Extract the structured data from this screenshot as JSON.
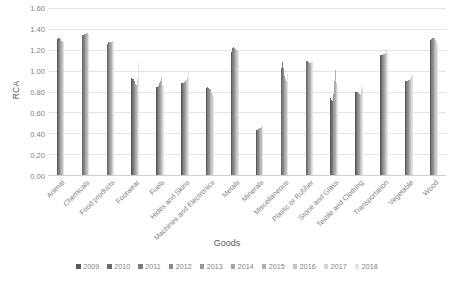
{
  "chart_data": {
    "type": "bar",
    "title": "",
    "xlabel": "Goods",
    "ylabel": "RCA",
    "ylim": [
      0.0,
      1.6
    ],
    "ytick_labels": [
      "0.00",
      "0.20",
      "0.40",
      "0.60",
      "0.80",
      "1.00",
      "1.20",
      "1.40",
      "1.60"
    ],
    "ytick_values": [
      0.0,
      0.2,
      0.4,
      0.6,
      0.8,
      1.0,
      1.2,
      1.4,
      1.6
    ],
    "grid": true,
    "legend_position": "bottom",
    "categories": [
      "Animal",
      "Chemicals",
      "Food products",
      "Footwear",
      "Fuels",
      "Hides and Skins",
      "Machines and Electronics",
      "Metals",
      "Minerals",
      "Miscellaneous",
      "Plastic or Rubber",
      "Stone and Glass",
      "Textile and Clothing",
      "Transportation",
      "Vegetable",
      "Wood"
    ],
    "series": [
      {
        "name": "2009",
        "color": "#595959",
        "values": [
          1.3,
          1.33,
          1.26,
          0.93,
          0.84,
          0.88,
          0.83,
          1.18,
          0.43,
          1.0,
          1.09,
          0.74,
          0.8,
          1.15,
          0.9,
          1.29
        ]
      },
      {
        "name": "2010",
        "color": "#6b6b6b",
        "values": [
          1.31,
          1.34,
          1.26,
          0.92,
          0.84,
          0.88,
          0.83,
          1.21,
          0.43,
          1.03,
          1.09,
          0.72,
          0.8,
          1.15,
          0.9,
          1.3
        ]
      },
      {
        "name": "2011",
        "color": "#7a7a7a",
        "values": [
          1.31,
          1.34,
          1.27,
          0.92,
          0.84,
          0.88,
          0.84,
          1.22,
          0.43,
          1.08,
          1.09,
          0.71,
          0.8,
          1.15,
          0.9,
          1.3
        ]
      },
      {
        "name": "2012",
        "color": "#888888",
        "values": [
          1.31,
          1.35,
          1.27,
          0.9,
          0.85,
          0.88,
          0.83,
          1.23,
          0.44,
          1.03,
          1.08,
          0.73,
          0.79,
          1.15,
          0.9,
          1.31
        ]
      },
      {
        "name": "2013",
        "color": "#969696",
        "values": [
          1.3,
          1.35,
          1.27,
          0.88,
          0.88,
          0.89,
          0.82,
          1.22,
          0.44,
          0.95,
          1.08,
          0.78,
          0.79,
          1.16,
          0.91,
          1.31
        ]
      },
      {
        "name": "2014",
        "color": "#a4a4a4",
        "values": [
          1.29,
          1.35,
          1.27,
          0.87,
          0.9,
          0.9,
          0.82,
          1.21,
          0.45,
          0.93,
          1.07,
          0.9,
          0.78,
          1.16,
          0.91,
          1.31
        ]
      },
      {
        "name": "2015",
        "color": "#b2b2b2",
        "values": [
          1.28,
          1.36,
          1.27,
          0.86,
          0.93,
          0.9,
          0.81,
          1.2,
          0.45,
          0.92,
          1.07,
          1.01,
          0.77,
          1.16,
          0.91,
          1.3
        ]
      },
      {
        "name": "2016",
        "color": "#c2c2c2",
        "values": [
          1.28,
          1.36,
          1.28,
          0.86,
          0.86,
          0.91,
          0.79,
          1.2,
          0.46,
          0.9,
          1.08,
          0.88,
          0.76,
          1.17,
          0.92,
          1.29
        ]
      },
      {
        "name": "2017",
        "color": "#d4d4d4",
        "values": [
          1.27,
          1.35,
          1.28,
          0.92,
          0.86,
          0.94,
          0.78,
          1.2,
          0.47,
          0.97,
          1.08,
          0.83,
          0.82,
          1.2,
          0.95,
          1.27
        ]
      },
      {
        "name": "2018",
        "color": "#e3e3e3",
        "values": [
          1.27,
          1.35,
          1.28,
          1.07,
          0.86,
          0.99,
          0.76,
          1.2,
          0.48,
          0.96,
          1.08,
          0.83,
          0.85,
          1.17,
          0.96,
          1.26
        ]
      }
    ]
  }
}
